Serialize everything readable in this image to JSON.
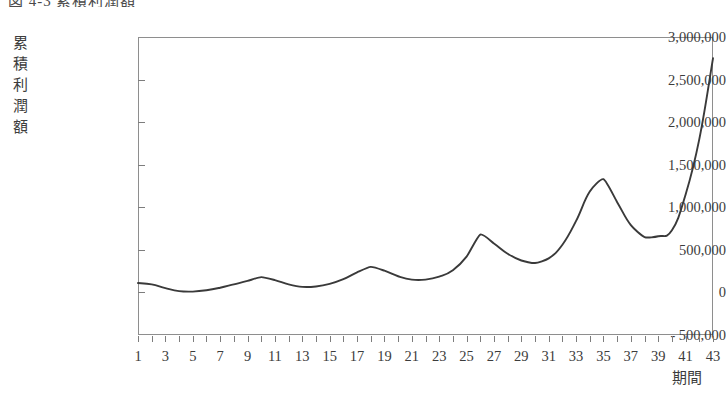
{
  "figure": {
    "caption_partial": "図 4-3  累積利潤額",
    "caption_visible_note": "cut off at top edge"
  },
  "chart_data": {
    "type": "line",
    "title": "図 4-3  累積利潤額",
    "xlabel": "期間",
    "ylabel": "累積利潤額",
    "ylabel_chars": [
      "累",
      "積",
      "利",
      "潤",
      "額"
    ],
    "grid": false,
    "legend": "none",
    "line_color": "#3a3a3a",
    "frame_color": "#8e8e8e",
    "background": "#ffffff",
    "xlim": [
      1,
      43
    ],
    "ylim": [
      -500000,
      3000000
    ],
    "ytick_labels": [
      "3,000,000",
      "2,500,000",
      "2,000,000",
      "1,500,000",
      "1,000,000",
      "500,000",
      "0",
      "- 500,000"
    ],
    "ytick_values": [
      3000000,
      2500000,
      2000000,
      1500000,
      1000000,
      500000,
      0,
      -500000
    ],
    "xtick_labels": [
      "1",
      "3",
      "5",
      "7",
      "9",
      "11",
      "13",
      "15",
      "17",
      "19",
      "21",
      "23",
      "25",
      "27",
      "29",
      "31",
      "33",
      "35",
      "37",
      "39",
      "41",
      "43"
    ],
    "xtick_values": [
      1,
      3,
      5,
      7,
      9,
      11,
      13,
      15,
      17,
      19,
      21,
      23,
      25,
      27,
      29,
      31,
      33,
      35,
      37,
      39,
      41,
      43
    ],
    "x": [
      1,
      2,
      3,
      4,
      5,
      6,
      7,
      8,
      9,
      10,
      11,
      12,
      13,
      14,
      15,
      16,
      17,
      18,
      19,
      20,
      21,
      22,
      23,
      24,
      25,
      26,
      27,
      28,
      29,
      30,
      31,
      32,
      33,
      34,
      35,
      36,
      37,
      38,
      39,
      40,
      41,
      42,
      43
    ],
    "values": [
      110000,
      95000,
      50000,
      15000,
      10000,
      25000,
      55000,
      95000,
      135000,
      180000,
      145000,
      95000,
      65000,
      70000,
      100000,
      155000,
      235000,
      300000,
      255000,
      190000,
      150000,
      150000,
      185000,
      260000,
      420000,
      680000,
      575000,
      455000,
      375000,
      345000,
      400000,
      560000,
      840000,
      1185000,
      1330000,
      1060000,
      790000,
      650000,
      660000,
      730000,
      1150000,
      1800000,
      2750000
    ],
    "series_name": "累積利潤額"
  }
}
